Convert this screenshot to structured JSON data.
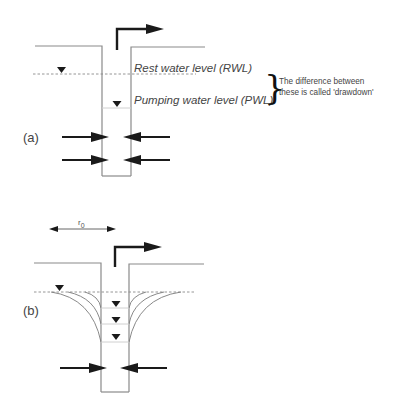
{
  "panel_a": {
    "label": "(a)",
    "rwl_label": "Rest water level (RWL)",
    "pwl_label": "Pumping water level (PWL)",
    "note_line1": "The difference between",
    "note_line2": "these is called 'drawdown'"
  },
  "panel_b": {
    "label": "(b)",
    "radius_label": "r",
    "radius_subscript": "0"
  },
  "icons": {
    "water_level": "inverted-triangle",
    "pump_outflow": "bent-arrow-right",
    "inflow": "arrow-horizontal"
  },
  "colors": {
    "line": "#8a8a8a",
    "ink": "#1a1a1a",
    "text": "#444444"
  }
}
